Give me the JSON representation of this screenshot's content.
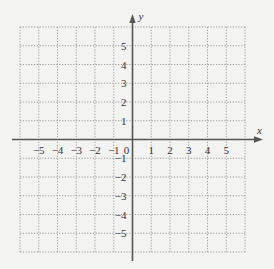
{
  "diagram": {
    "type": "coordinate-plane",
    "x_axis_label": "x",
    "y_axis_label": "y",
    "x_range": [
      -6,
      6
    ],
    "y_range": [
      -6,
      6
    ],
    "grid_step": 1,
    "x_tick_labels": [
      "-5",
      "-4",
      "-3",
      "-2",
      "-1",
      "0",
      "1",
      "2",
      "3",
      "4",
      "5"
    ],
    "x_tick_values": [
      -5,
      -4,
      -3,
      -2,
      -1,
      0,
      1,
      2,
      3,
      4,
      5
    ],
    "y_tick_labels": [
      "5",
      "4",
      "3",
      "2",
      "1",
      "-1",
      "-2",
      "-3",
      "-4",
      "-5"
    ],
    "y_tick_values": [
      5,
      4,
      3,
      2,
      1,
      -1,
      -2,
      -3,
      -4,
      -5
    ],
    "colors": {
      "background": "#f3f3f2",
      "grid": "#9a9a9a",
      "axis": "#555555",
      "text": "#333333"
    }
  }
}
